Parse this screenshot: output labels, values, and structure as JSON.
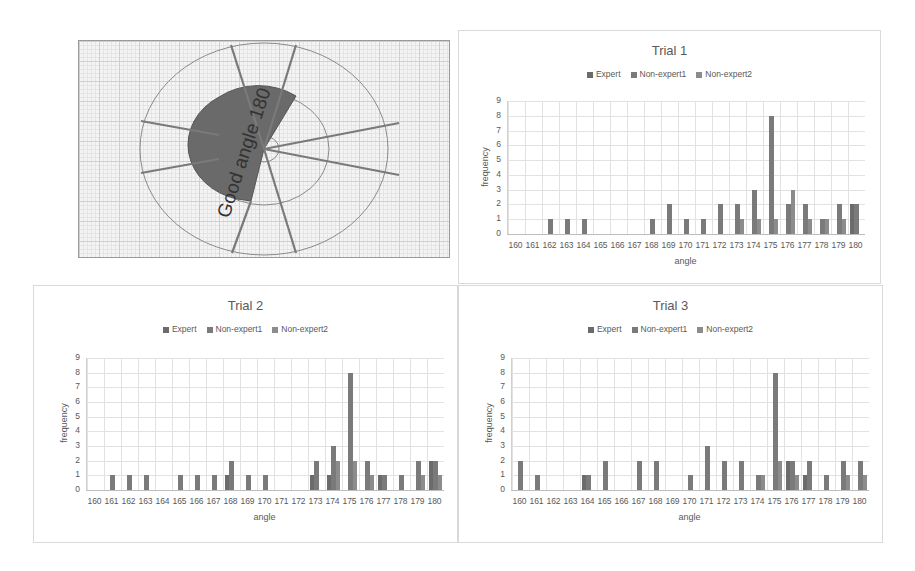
{
  "diagram": {
    "label": "Good angle 180"
  },
  "chart_data": [
    {
      "type": "bar",
      "title": "Trial 1",
      "xlabel": "angle",
      "ylabel": "frequency",
      "ylim": [
        0,
        9
      ],
      "yticks": [
        0,
        1,
        2,
        3,
        4,
        5,
        6,
        7,
        8,
        9
      ],
      "grid": true,
      "legend_position": "top",
      "categories": [
        "160",
        "161",
        "162",
        "163",
        "164",
        "165",
        "166",
        "167",
        "168",
        "169",
        "170",
        "171",
        "172",
        "173",
        "174",
        "175",
        "176",
        "177",
        "178",
        "179",
        "180"
      ],
      "series": [
        {
          "name": "Expert",
          "values": [
            0,
            0,
            0,
            0,
            0,
            0,
            0,
            0,
            0,
            0,
            0,
            0,
            0,
            0,
            0,
            0,
            0,
            0,
            0,
            0,
            2
          ]
        },
        {
          "name": "Non-expert1",
          "values": [
            0,
            0,
            1,
            1,
            1,
            0,
            0,
            0,
            1,
            2,
            1,
            1,
            2,
            2,
            3,
            8,
            2,
            2,
            1,
            2,
            2
          ]
        },
        {
          "name": "Non-expert2",
          "values": [
            0,
            0,
            0,
            0,
            0,
            0,
            0,
            0,
            0,
            0,
            0,
            0,
            0,
            1,
            1,
            1,
            3,
            1,
            1,
            1,
            0
          ]
        }
      ]
    },
    {
      "type": "bar",
      "title": "Trial 2",
      "xlabel": "angle",
      "ylabel": "frequency",
      "ylim": [
        0,
        9
      ],
      "yticks": [
        0,
        1,
        2,
        3,
        4,
        5,
        6,
        7,
        8,
        9
      ],
      "grid": true,
      "legend_position": "top",
      "categories": [
        "160",
        "161",
        "162",
        "163",
        "164",
        "165",
        "166",
        "167",
        "168",
        "169",
        "170",
        "171",
        "172",
        "173",
        "174",
        "175",
        "176",
        "177",
        "178",
        "179",
        "180"
      ],
      "series": [
        {
          "name": "Expert",
          "values": [
            0,
            0,
            0,
            0,
            0,
            0,
            0,
            0,
            1,
            0,
            0,
            0,
            0,
            1,
            1,
            0,
            0,
            1,
            0,
            0,
            2
          ]
        },
        {
          "name": "Non-expert1",
          "values": [
            0,
            1,
            1,
            1,
            0,
            1,
            1,
            1,
            2,
            1,
            1,
            0,
            0,
            2,
            3,
            8,
            2,
            1,
            1,
            2,
            2
          ]
        },
        {
          "name": "Non-expert2",
          "values": [
            0,
            0,
            0,
            0,
            0,
            0,
            0,
            0,
            0,
            0,
            0,
            0,
            0,
            0,
            2,
            2,
            1,
            0,
            0,
            1,
            1
          ]
        }
      ]
    },
    {
      "type": "bar",
      "title": "Trial 3",
      "xlabel": "angle",
      "ylabel": "frequency",
      "ylim": [
        0,
        9
      ],
      "yticks": [
        0,
        1,
        2,
        3,
        4,
        5,
        6,
        7,
        8,
        9
      ],
      "grid": true,
      "legend_position": "top",
      "categories": [
        "160",
        "161",
        "162",
        "163",
        "164",
        "165",
        "166",
        "167",
        "168",
        "169",
        "170",
        "171",
        "172",
        "173",
        "174",
        "175",
        "176",
        "177",
        "178",
        "179",
        "180"
      ],
      "series": [
        {
          "name": "Expert",
          "values": [
            0,
            0,
            0,
            0,
            1,
            0,
            0,
            0,
            0,
            0,
            0,
            0,
            0,
            0,
            0,
            0,
            2,
            1,
            0,
            0,
            0
          ]
        },
        {
          "name": "Non-expert1",
          "values": [
            2,
            1,
            0,
            0,
            1,
            2,
            0,
            2,
            2,
            0,
            1,
            3,
            2,
            2,
            1,
            8,
            2,
            2,
            1,
            2,
            2
          ]
        },
        {
          "name": "Non-expert2",
          "values": [
            0,
            0,
            0,
            0,
            0,
            0,
            0,
            0,
            0,
            0,
            0,
            0,
            0,
            0,
            1,
            2,
            1,
            0,
            0,
            1,
            1
          ]
        }
      ]
    }
  ],
  "colors": {
    "Expert": "#6b6b6b",
    "Non-expert1": "#7a7a7a",
    "Non-expert2": "#8c8c8c"
  }
}
